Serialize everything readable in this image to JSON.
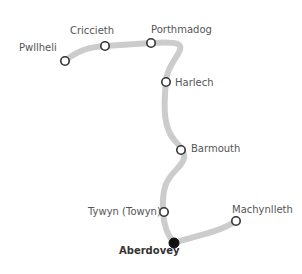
{
  "map": {
    "route_color": "#cccccc",
    "station_stroke": "#333333",
    "highlight_color": "#111111",
    "stations": [
      {
        "name": "Pwllheli",
        "x": 65,
        "y": 61
      },
      {
        "name": "Criccieth",
        "x": 105,
        "y": 46
      },
      {
        "name": "Porthmadog",
        "x": 151,
        "y": 43
      },
      {
        "name": "Harlech",
        "x": 166,
        "y": 82
      },
      {
        "name": "Barmouth",
        "x": 181,
        "y": 150
      },
      {
        "name": "Tywyn (Towyn)",
        "x": 164,
        "y": 212
      },
      {
        "name": "Aberdovey",
        "x": 174,
        "y": 243,
        "highlight": true
      },
      {
        "name": "Machynlleth",
        "x": 236,
        "y": 221
      }
    ]
  }
}
